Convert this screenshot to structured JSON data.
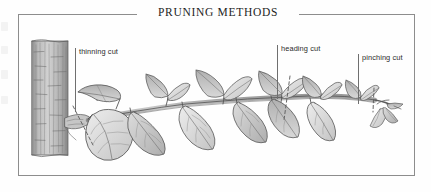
{
  "plate": {
    "title": "PRUNING METHODS",
    "frame_color": "#8d8d8d",
    "background_color": "#fefefe"
  },
  "illustration": {
    "name": "branch-pruning-diagram",
    "description": "Pen-and-ink botanical illustration of a tree trunk with a leafy branch, marked with three pruning cut locations",
    "style": "grayscale ink and wash",
    "elements": {
      "trunk": "tree-trunk-with-bark-texture",
      "branch_collar": "branch-collar",
      "stem": "main-branch-stem",
      "leaves": "ovate-leaves",
      "terminal_bud": "terminal-bud-cluster",
      "cut_marks": "dashed-cut-lines"
    },
    "ink_color": "#4a4a4a",
    "leaf_fill_light": "#e6e6e6",
    "leaf_fill_mid": "#cfcfcf",
    "leaf_fill_dark": "#b2b2b2",
    "bark_color": "#a9a9a9"
  },
  "callouts": [
    {
      "id": "thinning-cut",
      "label": "thinning cut",
      "x": 57,
      "y": 34,
      "leader_height": 64
    },
    {
      "id": "heading-cut",
      "label": "heading cut",
      "x": 259,
      "y": 31,
      "leader_height": 54
    },
    {
      "id": "pinching-cut",
      "label": "pinching cut",
      "x": 340,
      "y": 40,
      "leader_height": 50
    }
  ]
}
